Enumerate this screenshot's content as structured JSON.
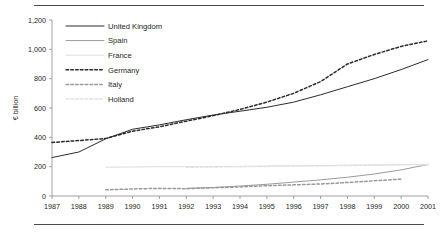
{
  "figure": {
    "frame_top_rule": "horizontal-rule",
    "frame_bottom_rule": "horizontal-rule"
  },
  "chart_data": {
    "type": "line",
    "title": "",
    "xlabel": "",
    "ylabel": "€ billion",
    "ylim": [
      0,
      1200
    ],
    "yticks": [
      0,
      200,
      400,
      600,
      800,
      1000,
      1200
    ],
    "ytick_labels": [
      "0",
      "200",
      "400",
      "600",
      "800",
      "1,000",
      "1,200"
    ],
    "grid": false,
    "legend_position": "upper-left-inside",
    "x": [
      1987,
      1988,
      1989,
      1990,
      1991,
      1992,
      1993,
      1994,
      1995,
      1996,
      1997,
      1998,
      1999,
      2000,
      2001
    ],
    "xtick_labels": [
      "1987",
      "1988",
      "1989",
      "1990",
      "1991",
      "1992",
      "1993",
      "1994",
      "1995",
      "1996",
      "1997",
      "1998",
      "1999",
      "2000",
      "2001"
    ],
    "series": [
      {
        "name": "United Kingdom",
        "style": "solid",
        "color": "#2b2b2b",
        "values": [
          262,
          300,
          390,
          455,
          485,
          520,
          552,
          578,
          605,
          640,
          690,
          745,
          800,
          862,
          930
        ]
      },
      {
        "name": "Spain",
        "style": "solid",
        "color": "#9a9a9a",
        "values": [
          null,
          null,
          null,
          null,
          null,
          52,
          58,
          68,
          80,
          95,
          110,
          128,
          150,
          178,
          215
        ]
      },
      {
        "name": "France",
        "style": "solid",
        "color": "#dcdcdc",
        "values": [
          null,
          null,
          196,
          198,
          200,
          200,
          200,
          202,
          204,
          206,
          208,
          210,
          212,
          214,
          216
        ]
      },
      {
        "name": "Germany",
        "style": "dashed",
        "color": "#2b2b2b",
        "values": [
          365,
          378,
          392,
          442,
          472,
          510,
          548,
          590,
          640,
          700,
          780,
          900,
          965,
          1020,
          1058
        ]
      },
      {
        "name": "Italy",
        "style": "dashed",
        "color": "#9a9a9a",
        "values": [
          null,
          null,
          42,
          48,
          52,
          50,
          56,
          62,
          70,
          76,
          82,
          92,
          104,
          115,
          null
        ]
      },
      {
        "name": "Holland",
        "style": "dashed",
        "color": "#e2e2e2",
        "values": [
          null,
          null,
          null,
          null,
          null,
          196,
          198,
          200,
          202,
          204,
          206,
          208,
          210,
          212,
          214
        ]
      }
    ]
  }
}
